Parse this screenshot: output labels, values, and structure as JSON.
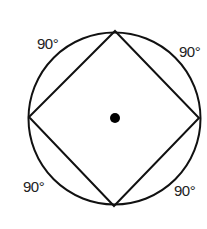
{
  "diagram": {
    "stroke_color": "#111111",
    "circle": {
      "cx": 114.5,
      "cy": 118.5,
      "r": 86
    },
    "center_point": {
      "cx": 115,
      "cy": 118,
      "r": 5
    },
    "square_vertices": [
      {
        "name": "top",
        "x": 115,
        "y": 31
      },
      {
        "name": "right",
        "x": 199,
        "y": 118
      },
      {
        "name": "bottom",
        "x": 114,
        "y": 206
      },
      {
        "name": "left",
        "x": 29,
        "y": 117
      }
    ],
    "arc_labels": [
      {
        "position": "top-left",
        "text": "90°",
        "x": 37,
        "y": 49
      },
      {
        "position": "top-right",
        "text": "90°",
        "x": 179,
        "y": 57
      },
      {
        "position": "bottom-left",
        "text": "90°",
        "x": 23,
        "y": 192
      },
      {
        "position": "bottom-right",
        "text": "90°",
        "x": 174,
        "y": 196
      }
    ]
  }
}
